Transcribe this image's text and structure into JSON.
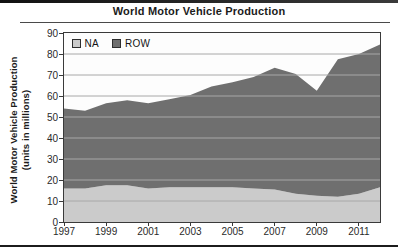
{
  "figure": {
    "title": "World Motor Vehicle Production"
  },
  "chart_data": {
    "type": "area",
    "stacked": true,
    "title": "World Motor Vehicle Production",
    "ylabel_line1": "World Motor Vehicle Production",
    "ylabel_line2": "(units in millions)",
    "x": [
      1997,
      1998,
      1999,
      2000,
      2001,
      2002,
      2003,
      2004,
      2005,
      2006,
      2007,
      2008,
      2009,
      2010,
      2011,
      2012
    ],
    "xticks": [
      1997,
      1999,
      2001,
      2003,
      2005,
      2007,
      2009,
      2011
    ],
    "ylim": [
      0,
      90
    ],
    "ytick_step": 10,
    "grid": "horizontal",
    "legend_position": "top-left-inside",
    "series": [
      {
        "name": "NA",
        "color": "#cbcbcb",
        "values": [
          16,
          16,
          17.5,
          17.5,
          16,
          16.5,
          16.5,
          16.5,
          16.5,
          16,
          15.5,
          13.5,
          12.5,
          12,
          13.5,
          16.5
        ]
      },
      {
        "name": "ROW",
        "color": "#6f6f6f",
        "values": [
          38,
          37,
          39,
          40.5,
          40.5,
          42,
          44,
          48,
          50,
          53,
          58,
          57,
          50,
          65.5,
          66.5,
          68
        ]
      }
    ],
    "stacked_totals": [
      54,
      53,
      56.5,
      58,
      56.5,
      58.5,
      60.5,
      64.5,
      66.5,
      69,
      73.5,
      70.5,
      62.5,
      77.5,
      80,
      84.5
    ],
    "colors": {
      "axis": "#3a3a3a",
      "grid": "#a8a8a8",
      "tick_label": "#2a2a2a",
      "frame_rule": "#1c1c1c"
    }
  }
}
